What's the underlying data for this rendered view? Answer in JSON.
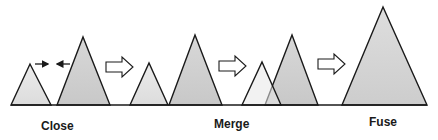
{
  "diagram": {
    "type": "process-sequence",
    "colors": {
      "background": "#ffffff",
      "stroke": "#1a1a1a",
      "small_peak_fill": "#e2e2e2",
      "large_peak_fill": "#cfcfcf",
      "fused_peak_fill": "#d6d6d6",
      "arrow_fill": "#ffffff"
    },
    "stages": [
      {
        "id": "close",
        "label": "Close",
        "label_x": 41,
        "label_y": 119
      },
      {
        "id": "merge",
        "label": "Merge",
        "label_x": 214,
        "label_y": 117
      },
      {
        "id": "fuse",
        "label": "Fuse",
        "label_x": 369,
        "label_y": 115
      }
    ],
    "baseline": {
      "x1": 11,
      "x2": 427,
      "y": 105
    },
    "peaks": [
      {
        "name": "close-small-peak",
        "points": "11,105 30,64 51,105",
        "fill": "small"
      },
      {
        "name": "close-large-peak",
        "points": "57,105 83,37 110,105",
        "fill": "large"
      },
      {
        "name": "merge-small-peak",
        "points": "130,105 149,63 168,105",
        "fill": "small"
      },
      {
        "name": "merge-large-peak",
        "points": "169,105 195,35 222,105",
        "fill": "large"
      },
      {
        "name": "overlap-large-peak",
        "points": "265,105 292,35 318,105",
        "fill": "large"
      },
      {
        "name": "overlap-small-peak",
        "points": "242,105 262,62 281,105",
        "fill": "small_translucent"
      },
      {
        "name": "fused-peak",
        "points": "342,105 383,7 427,105",
        "fill": "fused"
      }
    ],
    "approach_arrows": [
      {
        "name": "right-pointing-arrow-icon",
        "x1": 35,
        "x2": 48,
        "y": 64,
        "direction": "right"
      },
      {
        "name": "left-pointing-arrow-icon",
        "x1": 70,
        "x2": 57,
        "y": 64,
        "direction": "left"
      }
    ],
    "transition_arrows": [
      {
        "name": "transition-arrow-1-icon",
        "x": 106,
        "y": 67
      },
      {
        "name": "transition-arrow-2-icon",
        "x": 219,
        "y": 66
      },
      {
        "name": "transition-arrow-3-icon",
        "x": 318,
        "y": 64
      }
    ]
  }
}
